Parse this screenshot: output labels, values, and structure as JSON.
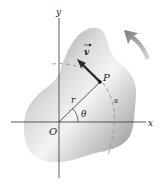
{
  "diagram": {
    "type": "rigid body rotating about origin",
    "labels": {
      "y_axis": "y",
      "x_axis": "x",
      "origin": "O",
      "point": "P",
      "velocity": "v",
      "radius": "r",
      "angle": "θ",
      "arc_length": "s"
    },
    "colors": {
      "body_light": "#f2f2f2",
      "body_dark": "#8a8a8a",
      "axis": "#333333",
      "vector": "#2a2a2a",
      "dashed_arc": "#9a9a9a",
      "rotation_arrow": "#8f8f8f"
    },
    "rotation_direction": "counterclockwise"
  }
}
